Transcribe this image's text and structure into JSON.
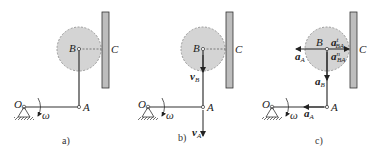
{
  "panels": [
    {
      "id": "a",
      "caption": "a)",
      "labels": {
        "O": "O",
        "A": "A",
        "B": "B",
        "C": "C",
        "omega": "ω"
      }
    },
    {
      "id": "b",
      "caption": "b)",
      "labels": {
        "O": "O",
        "A": "A",
        "B": "B",
        "C": "C",
        "omega": "ω",
        "vB": "v",
        "vB_sub": "B",
        "vA": "v",
        "vA_sub": "A"
      }
    },
    {
      "id": "c",
      "caption": "c)",
      "labels": {
        "O": "O",
        "A": "A",
        "B": "B",
        "C": "C",
        "omega": "ω",
        "aA_top": "a",
        "aA_top_sub": "A",
        "aBAt": "a",
        "aBAt_sub": "BA",
        "aBAt_sup": "t",
        "aBAn": "a",
        "aBAn_sub": "BA",
        "aBAn_sup": "n",
        "aB": "a",
        "aB_sub": "B",
        "aA_bottom": "a",
        "aA_bottom_sub": "A"
      }
    }
  ],
  "colors": {
    "disk": "#d4d4d4",
    "wall": "#b8b8b8",
    "line": "#333333"
  }
}
